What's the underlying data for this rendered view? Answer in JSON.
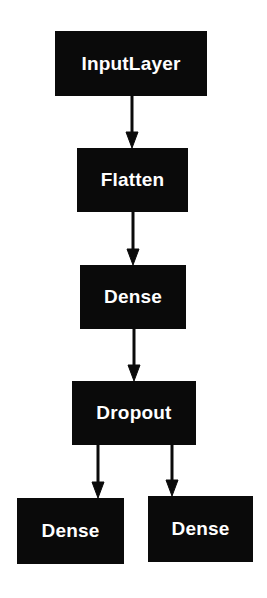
{
  "diagram": {
    "type": "model-graph",
    "nodes": [
      {
        "id": "input",
        "label": "InputLayer"
      },
      {
        "id": "flatten",
        "label": "Flatten"
      },
      {
        "id": "dense1",
        "label": "Dense"
      },
      {
        "id": "dropout",
        "label": "Dropout"
      },
      {
        "id": "dense2",
        "label": "Dense"
      },
      {
        "id": "dense3",
        "label": "Dense"
      }
    ],
    "edges": [
      {
        "from": "input",
        "to": "flatten"
      },
      {
        "from": "flatten",
        "to": "dense1"
      },
      {
        "from": "dense1",
        "to": "dropout"
      },
      {
        "from": "dropout",
        "to": "dense2"
      },
      {
        "from": "dropout",
        "to": "dense3"
      }
    ],
    "colors": {
      "node_fill": "#0a0a0a",
      "node_text": "#ffffff",
      "edge": "#0a0a0a",
      "background": "#ffffff"
    }
  }
}
